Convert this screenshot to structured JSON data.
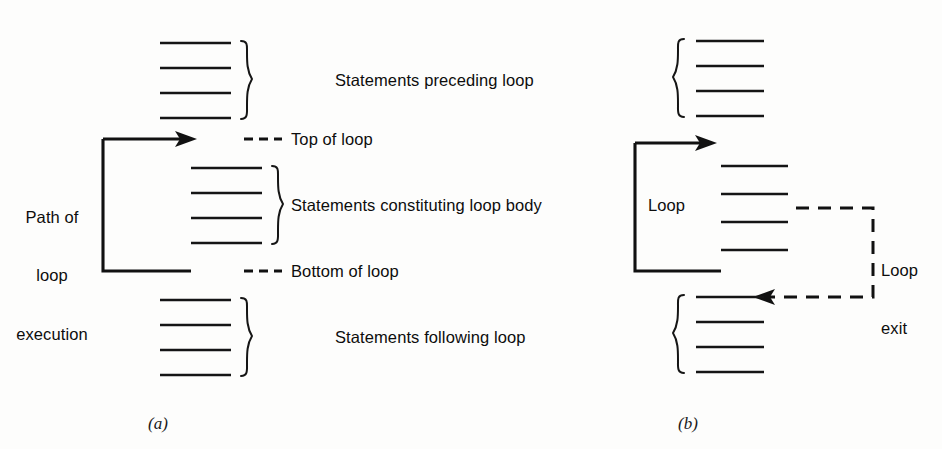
{
  "figure": {
    "background_color": "#fdfdfc",
    "ink_color": "#111111",
    "panels": [
      {
        "caption": "(a)",
        "labels": {
          "preceding": "Statements preceding loop",
          "top_of_loop": "Top of loop",
          "loop_body": "Statements constituting loop body",
          "bottom_of_loop": "Bottom of loop",
          "following": "Statements following loop",
          "path_line1": "Path of",
          "path_line2": "loop",
          "path_line3": "execution"
        },
        "statement_groups": [
          {
            "name": "preceding-loop-statements",
            "line_count": 4
          },
          {
            "name": "loop-body-statements",
            "line_count": 4
          },
          {
            "name": "following-loop-statements",
            "line_count": 4
          }
        ]
      },
      {
        "caption": "(b)",
        "labels": {
          "loop": "Loop",
          "loop_exit_line1": "Loop",
          "loop_exit_line2": "exit"
        },
        "statement_groups": [
          {
            "name": "preceding-loop-statements",
            "line_count": 4
          },
          {
            "name": "loop-body-statements",
            "line_count": 4
          },
          {
            "name": "following-loop-statements",
            "line_count": 4
          }
        ]
      }
    ]
  }
}
